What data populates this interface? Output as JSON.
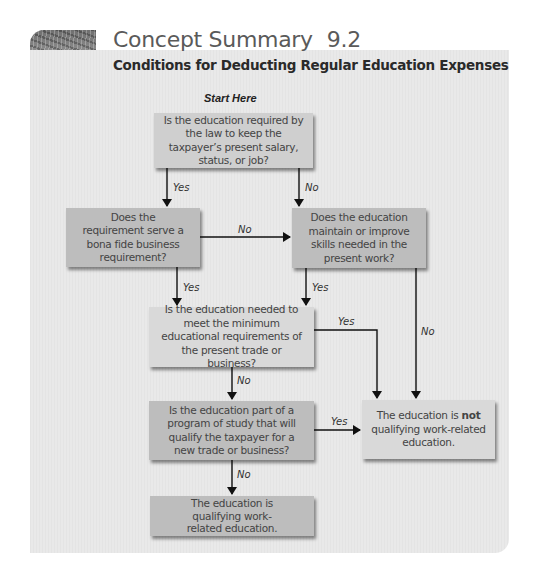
{
  "header": {
    "title": "Concept Summary",
    "number": "9.2",
    "subtitle": "Conditions for Deducting Regular Education Expenses"
  },
  "flowchart": {
    "start_label": "Start Here",
    "nodes": [
      {
        "id": "q1",
        "text": "Is the education required by the law to keep the taxpayer’s present salary, status, or job?"
      },
      {
        "id": "q2",
        "text": "Does the requirement serve a bona fide business requirement?"
      },
      {
        "id": "q3",
        "text": "Does the education maintain or improve skills needed in the present work?"
      },
      {
        "id": "q4",
        "text": "Is the education needed to meet the minimum educational requirements of the present trade or business?"
      },
      {
        "id": "q5",
        "text": "Is the education part of a program of study that will qualify the taxpayer for a new trade or business?"
      },
      {
        "id": "r_not",
        "text_before": "The education is ",
        "text_bold": "not",
        "text_after": " qualifying work-related education."
      },
      {
        "id": "r_yes",
        "text": "The education is qualifying work-related education."
      }
    ],
    "edges": [
      {
        "from": "q1",
        "to": "q2",
        "label": "Yes"
      },
      {
        "from": "q1",
        "to": "q3",
        "label": "No"
      },
      {
        "from": "q2",
        "to": "q3",
        "label": "No"
      },
      {
        "from": "q2",
        "to": "q4",
        "label": "Yes"
      },
      {
        "from": "q3",
        "to": "q4",
        "label": "Yes"
      },
      {
        "from": "q3",
        "to": "r_not",
        "label": "No"
      },
      {
        "from": "q4",
        "to": "r_not",
        "label": "Yes"
      },
      {
        "from": "q4",
        "to": "q5",
        "label": "No"
      },
      {
        "from": "q5",
        "to": "r_not",
        "label": "Yes"
      },
      {
        "from": "q5",
        "to": "r_yes",
        "label": "No"
      }
    ]
  }
}
